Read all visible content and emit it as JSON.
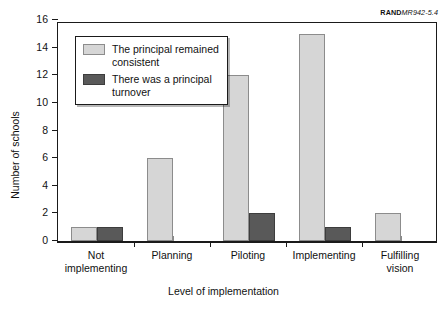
{
  "credit": {
    "mark": "RAND",
    "document": "MR942-5.4"
  },
  "legend": {
    "entries": [
      {
        "label": "The principal remained\nconsistent",
        "color": "#d6d6d6"
      },
      {
        "label": "There was a principal\nturnover",
        "color": "#595959"
      }
    ]
  },
  "chart_data": {
    "type": "bar",
    "title": "",
    "xlabel": "Level of implementation",
    "ylabel": "Number of schools",
    "categories": [
      "Not\nimplementing",
      "Planning",
      "Piloting",
      "Implementing",
      "Fulfilling\nvision"
    ],
    "series": [
      {
        "name": "The principal remained consistent",
        "color": "#d6d6d6",
        "values": [
          1,
          6,
          12,
          15,
          2
        ]
      },
      {
        "name": "There was a principal turnover",
        "color": "#595959",
        "values": [
          1,
          0,
          2,
          1,
          0
        ]
      }
    ],
    "ylim": [
      0,
      16
    ],
    "yticks": [
      0,
      2,
      4,
      6,
      8,
      10,
      12,
      14,
      16
    ],
    "ytick_labels": [
      "0",
      "2",
      "4",
      "6",
      "8",
      "10",
      "12",
      "14",
      "16"
    ],
    "grid": false,
    "legend_position": "upper left"
  }
}
